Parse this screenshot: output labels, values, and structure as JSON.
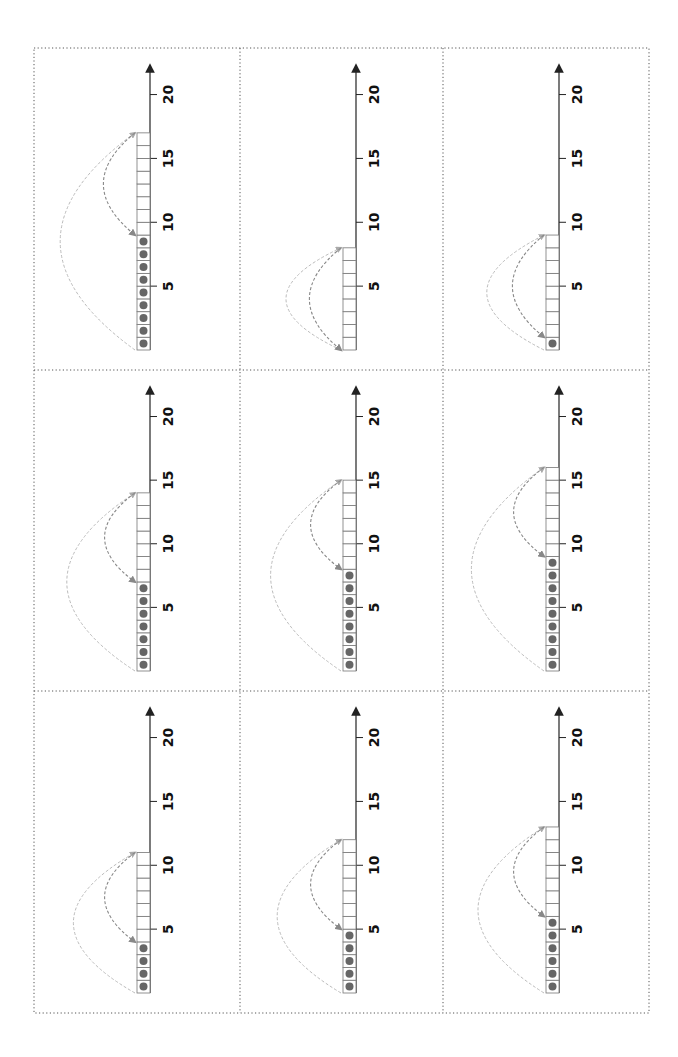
{
  "worksheet": {
    "orientation": "rotated-90-ccw",
    "grid": {
      "rows": 3,
      "cols": 3
    },
    "axis": {
      "min": 0,
      "max": 20,
      "tick_labels": [
        "5",
        "10",
        "15",
        "20"
      ]
    },
    "colors": {
      "border": "#555555",
      "axis": "#222222",
      "box_stroke": "#777777",
      "dot": "#666666",
      "arc_outer": "#bbbbbb",
      "arc_inner": "#888888",
      "label": "#111111"
    },
    "panels": [
      {
        "row": 0,
        "col": 0,
        "dots": 9,
        "boxes": 17
      },
      {
        "row": 0,
        "col": 1,
        "dots": 0,
        "boxes": 8
      },
      {
        "row": 0,
        "col": 2,
        "dots": 1,
        "boxes": 9
      },
      {
        "row": 1,
        "col": 0,
        "dots": 7,
        "boxes": 14
      },
      {
        "row": 1,
        "col": 1,
        "dots": 8,
        "boxes": 15
      },
      {
        "row": 1,
        "col": 2,
        "dots": 9,
        "boxes": 16
      },
      {
        "row": 2,
        "col": 0,
        "dots": 4,
        "boxes": 11
      },
      {
        "row": 2,
        "col": 1,
        "dots": 5,
        "boxes": 12
      },
      {
        "row": 2,
        "col": 2,
        "dots": 6,
        "boxes": 13
      }
    ]
  }
}
